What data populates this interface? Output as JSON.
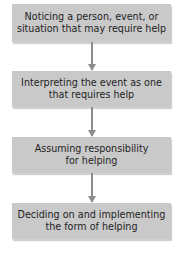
{
  "diagram": {
    "type": "flowchart",
    "direction": "top-to-bottom",
    "colors": {
      "box_fill": "#c9c9c9",
      "arrow": "#8c8c8c",
      "text": "#1e1e1e",
      "background": "#ffffff"
    },
    "steps": [
      {
        "line1": "Noticing a person, event, or",
        "line2": "situation that may require help"
      },
      {
        "line1": "Interpreting the event as one",
        "line2": "that requires help"
      },
      {
        "line1": "Assuming responsibility",
        "line2": "for helping"
      },
      {
        "line1": "Deciding on and implementing",
        "line2": "the form of helping"
      }
    ],
    "edges": [
      {
        "from": 0,
        "to": 1
      },
      {
        "from": 1,
        "to": 2
      },
      {
        "from": 2,
        "to": 3
      }
    ]
  }
}
